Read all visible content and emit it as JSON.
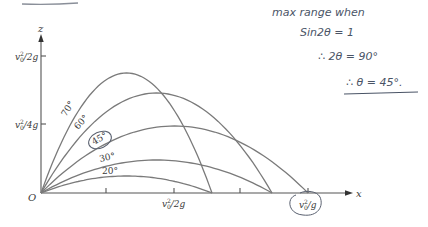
{
  "diagram": {
    "title_underline_visible": true,
    "axes": {
      "z_label": "z",
      "x_label": "x",
      "origin_label": "O",
      "z_ticks": [
        {
          "label": "v0²/2g",
          "num": "v",
          "sub": "0",
          "sup": "2",
          "rest": "/2g"
        },
        {
          "label": "v0²/4g",
          "num": "v",
          "sub": "0",
          "sup": "2",
          "rest": "/4g"
        }
      ],
      "x_ticks": [
        {
          "label": "v0²/2g",
          "num": "v",
          "sub": "0",
          "sup": "2",
          "rest": "/2g"
        },
        {
          "label": "v0²/g",
          "num": "v",
          "sub": "0",
          "sup": "2",
          "rest": "/g",
          "circled": true
        }
      ]
    },
    "trajectories": [
      {
        "angle_label": "70°",
        "angle": 70,
        "peak_x": 128,
        "peak_y": 73,
        "land_x": 212
      },
      {
        "angle_label": "60°",
        "angle": 60,
        "peak_x": 157,
        "peak_y": 93,
        "land_x": 272
      },
      {
        "angle_label": "45°",
        "angle": 45,
        "peak_x": 180,
        "peak_y": 126,
        "land_x": 308,
        "circled": true
      },
      {
        "angle_label": "30°",
        "angle": 30,
        "peak_x": 157,
        "peak_y": 160,
        "land_x": 272
      },
      {
        "angle_label": "20°",
        "angle": 20,
        "peak_x": 128,
        "peak_y": 176,
        "land_x": 212
      }
    ],
    "colors": {
      "curve": "#7a7a7a",
      "axis": "#555555",
      "handwriting": "#4a5466"
    }
  },
  "handwritten_notes": {
    "line1": "max range when",
    "line2": "Sin2θ = 1",
    "line3": "∴ 2θ = 90°",
    "line4": "∴ θ = 45°."
  }
}
